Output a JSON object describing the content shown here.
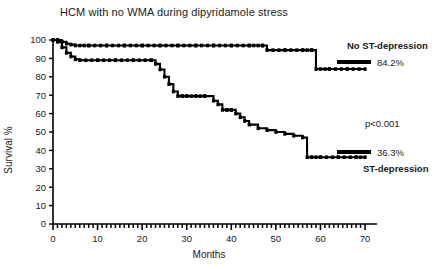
{
  "chart_data": {
    "type": "line",
    "title": "HCM with no WMA during dipyridamole stress",
    "xlabel": "Months",
    "ylabel": "Survival %",
    "xlim": [
      0,
      70
    ],
    "ylim": [
      0,
      100
    ],
    "xticks": [
      0,
      10,
      20,
      30,
      40,
      50,
      60,
      70
    ],
    "yticks": [
      0,
      10,
      20,
      30,
      40,
      50,
      60,
      70,
      80,
      90,
      100
    ],
    "grid": false,
    "legend_position": "right",
    "annotations": [
      {
        "text": "No ST-depression",
        "x": 72,
        "y": 97,
        "bold": true
      },
      {
        "text": "84.2%",
        "x": 74,
        "y": 88,
        "bold": false
      },
      {
        "text": "p<0.001",
        "x": 72,
        "y": 56,
        "bold": false
      },
      {
        "text": "36.3%",
        "x": 74,
        "y": 40,
        "bold": false
      },
      {
        "text": "ST-depression",
        "x": 72,
        "y": 32,
        "bold": true
      }
    ],
    "series": [
      {
        "name": "No ST-depression",
        "final_value": 84.2,
        "step": "post",
        "x": [
          0,
          1,
          2,
          3,
          4,
          5,
          8,
          12,
          16,
          20,
          24,
          28,
          32,
          36,
          40,
          44,
          47,
          48,
          52,
          56,
          58,
          59,
          62,
          66,
          70
        ],
        "y": [
          100,
          100,
          99,
          98,
          97.5,
          97,
          97,
          97,
          97,
          97,
          97,
          97,
          97,
          97,
          97,
          97,
          97,
          94.5,
          94.5,
          94.5,
          94.5,
          84.2,
          84.2,
          84.2,
          84.2
        ]
      },
      {
        "name": "ST-depression",
        "final_value": 36.3,
        "step": "post",
        "x": [
          0,
          1,
          2,
          3,
          4,
          5,
          6,
          10,
          14,
          18,
          22,
          23,
          24,
          25,
          26,
          27,
          28,
          29,
          30,
          32,
          34,
          36,
          37,
          38,
          39,
          40,
          41,
          42,
          43,
          44,
          46,
          48,
          50,
          52,
          54,
          56,
          57,
          58,
          60,
          64,
          68,
          70
        ],
        "y": [
          100,
          99,
          96,
          93,
          91,
          89.5,
          89,
          89,
          89,
          89,
          89,
          87,
          84,
          80,
          76,
          72,
          69.5,
          69.5,
          69.5,
          69.5,
          69.5,
          67,
          65,
          62,
          62,
          62,
          60,
          58,
          56,
          54,
          52,
          51,
          50,
          49,
          48,
          47,
          36.3,
          36.3,
          36.3,
          36.3,
          36.3,
          36.3
        ]
      }
    ]
  },
  "axes": {
    "x_tick_labels": [
      "0",
      "10",
      "20",
      "30",
      "40",
      "50",
      "60",
      "70"
    ],
    "y_tick_labels": [
      "0",
      "10",
      "20",
      "30",
      "40",
      "50",
      "60",
      "70",
      "80",
      "90",
      "100"
    ],
    "x_title": "Months",
    "y_title": "Survival %"
  },
  "title": {
    "text": "HCM with no WMA during dipyridamole stress"
  },
  "labels": {
    "no_st_depression": "No ST-depression",
    "no_st_value": "84.2%",
    "p_value": "p<0.001",
    "st_value": "36.3%",
    "st_depression": "ST-depression"
  },
  "colors": {
    "curve": "#000000",
    "axis": "#000000",
    "text": "#1a1a1a",
    "background": "#ffffff"
  }
}
